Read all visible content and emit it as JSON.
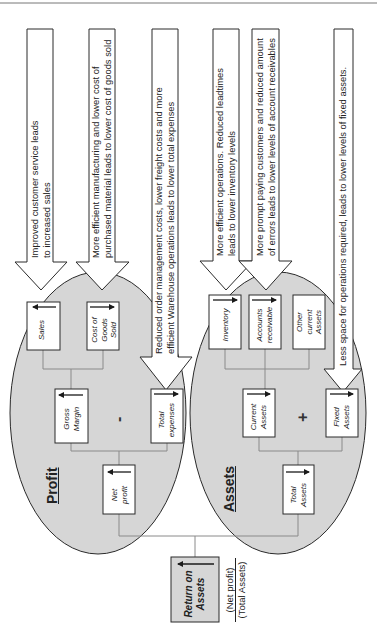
{
  "diagram": {
    "type": "return-on-assets-tree",
    "orientation": "rotated-90-ccw",
    "colors": {
      "ellipse_fill": "#d6d6d6",
      "box_fill": "#ffffff",
      "roa_box_fill": "#d6d6d6",
      "stroke": "#2a2a2a",
      "connector": "#8a8a8a"
    },
    "groups": {
      "profit": {
        "title": "Profit",
        "operator": "-"
      },
      "assets": {
        "title": "Assets",
        "operator": "+"
      }
    },
    "nodes": {
      "sales": {
        "label_lines": [
          "Sales"
        ],
        "trend": "increase"
      },
      "cogs": {
        "label_lines": [
          "Cost of",
          "Goods",
          "Sold"
        ],
        "trend": "decrease"
      },
      "gross_margin": {
        "label_lines": [
          "Gross",
          "Margin"
        ],
        "trend": "increase"
      },
      "total_expenses": {
        "label_lines": [
          "Total",
          "expenses"
        ],
        "trend": "decrease"
      },
      "net_profit": {
        "label_lines": [
          "Net",
          "profit"
        ],
        "trend": "increase"
      },
      "inventory": {
        "label_lines": [
          "Inventory"
        ],
        "trend": "decrease"
      },
      "accounts_receivable": {
        "label_lines": [
          "Accounts",
          "receivable"
        ],
        "trend": "decrease"
      },
      "other_current_assets": {
        "label_lines": [
          "Other",
          "current",
          "Assets"
        ],
        "trend": "none"
      },
      "current_assets": {
        "label_lines": [
          "Current",
          "Assets"
        ],
        "trend": "decrease"
      },
      "fixed_assets": {
        "label_lines": [
          "Fixed",
          "Assets"
        ],
        "trend": "decrease"
      },
      "total_assets": {
        "label_lines": [
          "Total",
          "Assets"
        ],
        "trend": "decrease"
      },
      "roa": {
        "label_lines": [
          "Return on",
          "Assets"
        ],
        "trend": "increase"
      }
    },
    "formula": {
      "numerator": "(Net profit)",
      "denominator": "(Total Assets)"
    },
    "callouts": [
      {
        "target": "sales",
        "lines": [
          "Improved customer service leads",
          "to increased sales"
        ]
      },
      {
        "target": "cogs",
        "lines": [
          "More efficient manufacturing and lower cost of",
          "purchased material leads to lower cost of goods sold"
        ]
      },
      {
        "target": "total_expenses",
        "lines": [
          "Reduced order management costs, lower freight costs and more",
          "efficient Warehouse operations leads to lower total expenses"
        ]
      },
      {
        "target": "inventory",
        "lines": [
          "More efficient operations. Reduced leadtimes",
          "leads to lower inventory levels"
        ]
      },
      {
        "target": "accounts_receivable",
        "lines": [
          "More prompt paying customers and reduced amount",
          "of errors leads to lower levels of account receivables"
        ]
      },
      {
        "target": "fixed_assets",
        "lines": [
          "Less space for operations required, leads to lower levels of fixed assets."
        ]
      }
    ]
  }
}
